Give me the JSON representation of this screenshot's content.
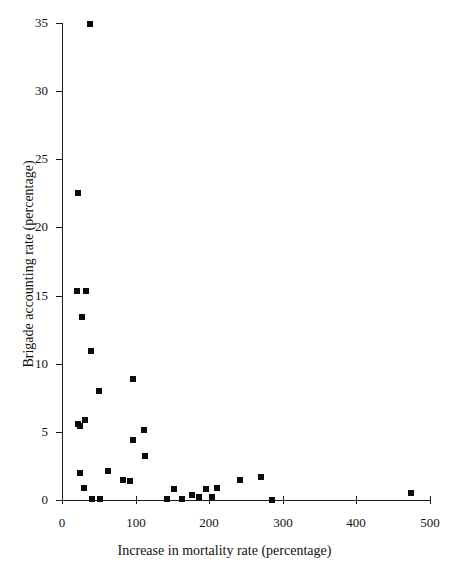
{
  "chart_data": {
    "type": "scatter",
    "title": "",
    "xlabel": "Increase in mortality rate (percentage)",
    "ylabel": "Brigade accounting rate (percentage)",
    "xlim": [
      0,
      500
    ],
    "ylim": [
      0,
      35
    ],
    "xticks": [
      0,
      100,
      200,
      300,
      400,
      500
    ],
    "yticks": [
      0,
      5,
      10,
      15,
      20,
      25,
      30,
      35
    ],
    "xtick_labels": [
      "0",
      "100",
      "200",
      "300",
      "400",
      "500"
    ],
    "ytick_labels": [
      "0",
      "5",
      "10",
      "15",
      "20",
      "25",
      "30",
      "35"
    ],
    "grid": false,
    "legend": null,
    "marker": "filled-square",
    "marker_color": "#0b0b0b",
    "background_color": "#ffffff",
    "series": [
      {
        "name": "brigades",
        "points": [
          {
            "x": 38,
            "y": 34.9
          },
          {
            "x": 22,
            "y": 22.5
          },
          {
            "x": 20,
            "y": 15.3
          },
          {
            "x": 33,
            "y": 15.3
          },
          {
            "x": 27,
            "y": 13.4
          },
          {
            "x": 40,
            "y": 10.9
          },
          {
            "x": 50,
            "y": 8.0
          },
          {
            "x": 97,
            "y": 8.9
          },
          {
            "x": 22,
            "y": 5.6
          },
          {
            "x": 25,
            "y": 5.4
          },
          {
            "x": 31,
            "y": 5.9
          },
          {
            "x": 97,
            "y": 4.4
          },
          {
            "x": 112,
            "y": 5.1
          },
          {
            "x": 113,
            "y": 3.2
          },
          {
            "x": 25,
            "y": 2.0
          },
          {
            "x": 63,
            "y": 2.1
          },
          {
            "x": 83,
            "y": 1.5
          },
          {
            "x": 93,
            "y": 1.4
          },
          {
            "x": 30,
            "y": 0.9
          },
          {
            "x": 152,
            "y": 0.8
          },
          {
            "x": 176,
            "y": 0.4
          },
          {
            "x": 196,
            "y": 0.8
          },
          {
            "x": 211,
            "y": 0.9
          },
          {
            "x": 242,
            "y": 1.5
          },
          {
            "x": 270,
            "y": 1.7
          },
          {
            "x": 474,
            "y": 0.5
          },
          {
            "x": 41,
            "y": 0.1
          },
          {
            "x": 52,
            "y": 0.1
          },
          {
            "x": 143,
            "y": 0.1
          },
          {
            "x": 163,
            "y": 0.1
          },
          {
            "x": 186,
            "y": 0.2
          },
          {
            "x": 204,
            "y": 0.25
          },
          {
            "x": 286,
            "y": 0.0
          }
        ]
      }
    ]
  }
}
